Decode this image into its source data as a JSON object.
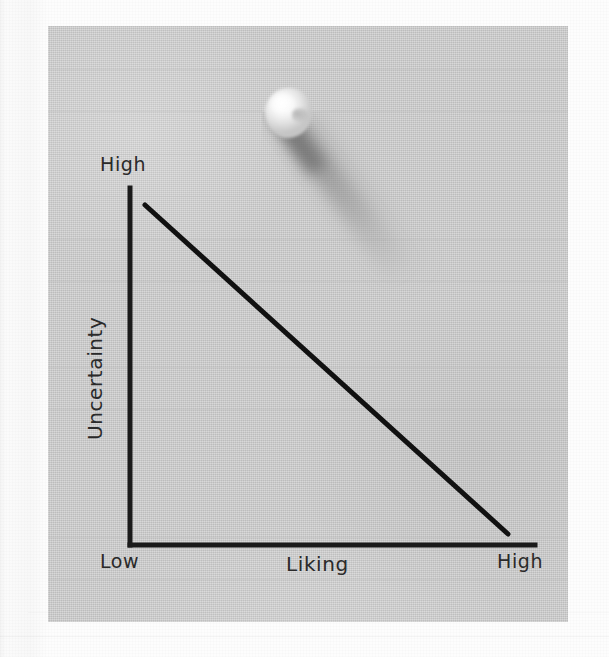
{
  "figure": {
    "media": "hand-drawn sketch on gray index card",
    "pin": {
      "icon": "pushpin-icon",
      "head_color": "#f2f2f2",
      "shadow_color": "#9a9a9a"
    },
    "card": {
      "background_color": "#c9c9c9",
      "frame_color": "#fafafa",
      "rule_line_color": "#bdbdbd",
      "rule_count": 13
    },
    "ink_color": "#1a1a1a"
  },
  "chart_data": {
    "type": "line",
    "title": "",
    "subtitle": "",
    "xlabel": "Liking",
    "ylabel": "Uncertainty",
    "x_tick_labels": [
      "Low",
      "High"
    ],
    "y_tick_labels": [
      "High"
    ],
    "x_axis_low_label": "Low",
    "x_axis_high_label": "High",
    "y_axis_high_label": "High",
    "grid": false,
    "legend_position": "none",
    "xlim": [
      0,
      1
    ],
    "ylim": [
      0,
      1
    ],
    "series": [
      {
        "name": "Uncertainty vs Liking",
        "x": [
          0.04,
          1.0
        ],
        "y": [
          0.95,
          0.03
        ],
        "style": "solid",
        "color": "#111111",
        "width_px": 5,
        "description": "straight line with steady negative slope from high uncertainty / low liking to low uncertainty / high liking"
      }
    ],
    "annotations": [],
    "axis_geometry": {
      "origin_px": [
        130,
        545
      ],
      "y_axis_top_px": [
        130,
        188
      ],
      "x_axis_right_px": [
        535,
        545
      ],
      "line_start_px": [
        145,
        205
      ],
      "line_end_px": [
        508,
        534
      ]
    }
  },
  "labels": {
    "y_high": "High",
    "y_title": "Uncertainty",
    "x_low": "Low",
    "x_high": "High",
    "x_title": "Liking"
  }
}
